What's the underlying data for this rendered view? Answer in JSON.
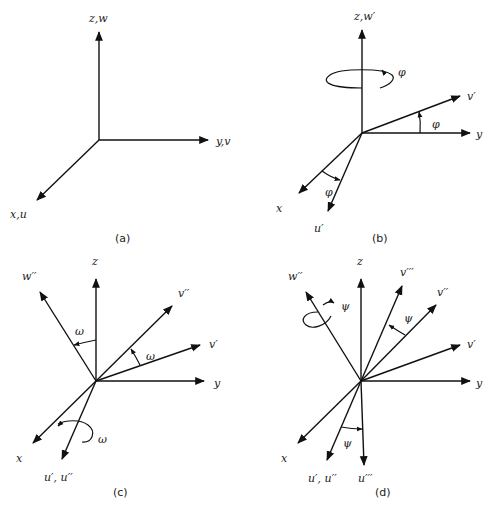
{
  "figure": {
    "panels": [
      {
        "id": "a",
        "caption": "(a)",
        "labels": {
          "z": "z,w",
          "y": "y,v",
          "x": "x,u"
        }
      },
      {
        "id": "b",
        "caption": "(b)",
        "labels": {
          "z": "z,w′",
          "y": "y",
          "x": "x",
          "vp": "v′",
          "up": "u′"
        },
        "angle_symbol": "φ",
        "rotation_about": "z"
      },
      {
        "id": "c",
        "caption": "(c)",
        "labels": {
          "z": "z",
          "y": "y",
          "x": "x",
          "wpp": "w′′",
          "vpp": "v′′",
          "vp": "v′",
          "upupp": "u′, u′′"
        },
        "angle_symbol": "ω",
        "rotation_about": "u′"
      },
      {
        "id": "d",
        "caption": "(d)",
        "labels": {
          "z": "z",
          "y": "y",
          "x": "x",
          "wpp": "w′′",
          "vppp": "v′′′",
          "vpp": "v′′",
          "vp": "v′",
          "upupp": "u′, u′′",
          "uppp": "u′′′"
        },
        "angle_symbol": "ψ",
        "rotation_about": "w′′"
      }
    ]
  }
}
